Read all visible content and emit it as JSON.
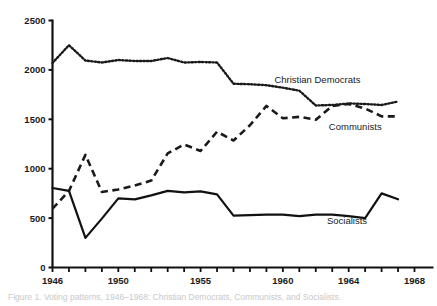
{
  "chart_data": {
    "type": "line",
    "title": "",
    "xlabel": "",
    "ylabel": "",
    "xlim": [
      1946,
      1968
    ],
    "ylim": [
      0,
      2500
    ],
    "grid": false,
    "legend_position": "inline-right",
    "y_ticks": [
      0,
      500,
      1000,
      1500,
      2000,
      2500
    ],
    "y_tick_labels": [
      "0",
      "500",
      "1000",
      "1500",
      "2000",
      "2500"
    ],
    "x_ticks": [
      1946,
      1947,
      1948,
      1949,
      1950,
      1951,
      1952,
      1953,
      1954,
      1955,
      1956,
      1957,
      1958,
      1959,
      1960,
      1961,
      1962,
      1963,
      1964,
      1965,
      1966,
      1967,
      1968
    ],
    "x_tick_labels": [
      {
        "x": 1946,
        "label": "1946"
      },
      {
        "x": 1950,
        "label": "1950"
      },
      {
        "x": 1955,
        "label": "1955"
      },
      {
        "x": 1960,
        "label": "1960"
      },
      {
        "x": 1964,
        "label": "1964"
      },
      {
        "x": 1968,
        "label": "1968"
      }
    ],
    "x": [
      1946,
      1947,
      1948,
      1949,
      1950,
      1951,
      1952,
      1953,
      1954,
      1955,
      1956,
      1957,
      1958,
      1959,
      1960,
      1961,
      1962,
      1963,
      1964,
      1965,
      1966,
      1967
    ],
    "series": [
      {
        "name": "Christian Democrats",
        "style": "dotted",
        "color": "#1a1a1a",
        "label_x": 1962.1,
        "label_y": 1870,
        "values": [
          2070,
          2250,
          2095,
          2075,
          2100,
          2090,
          2090,
          2120,
          2075,
          2080,
          2075,
          1860,
          1855,
          1845,
          1820,
          1790,
          1640,
          1645,
          1660,
          1655,
          1645,
          1680
        ]
      },
      {
        "name": "Communists",
        "style": "dashed",
        "color": "#1a1a1a",
        "label_x": 1964.4,
        "label_y": 1390,
        "values": [
          595,
          775,
          1140,
          765,
          790,
          830,
          880,
          1155,
          1245,
          1180,
          1375,
          1285,
          1440,
          1635,
          1510,
          1525,
          1495,
          1635,
          1655,
          1610,
          1530,
          1530
        ]
      },
      {
        "name": "Socialists",
        "style": "solid",
        "color": "#111111",
        "label_x": 1963.9,
        "label_y": 445,
        "values": [
          805,
          775,
          300,
          495,
          700,
          690,
          730,
          775,
          760,
          770,
          740,
          525,
          530,
          535,
          535,
          520,
          535,
          535,
          520,
          500,
          750,
          690
        ]
      }
    ]
  },
  "caption": {
    "text": "Figure 1.  Voting patterns, 1946–1968:  Christian Democrats, Communists, and Socialists."
  },
  "axis": {
    "y_axis_name": "vertical-axis",
    "x_axis_name": "horizontal-axis"
  }
}
